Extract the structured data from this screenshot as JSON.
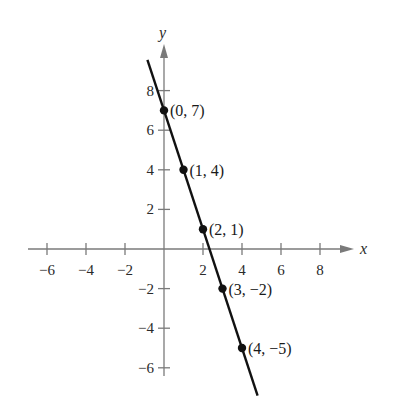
{
  "chart_data": {
    "type": "line",
    "title": "",
    "equation": "y = -3x + 7",
    "xlabel": "x",
    "ylabel": "y",
    "xlim": [
      -7,
      9
    ],
    "ylim": [
      -7,
      9
    ],
    "grid": false,
    "x_ticks": [
      -6,
      -4,
      -2,
      2,
      4,
      6,
      8
    ],
    "x_tick_labels": [
      "−6",
      "−4",
      "−2",
      "2",
      "4",
      "6",
      "8"
    ],
    "y_ticks": [
      8,
      6,
      4,
      2,
      -2,
      -4,
      -6
    ],
    "y_tick_labels": [
      "8",
      "6",
      "4",
      "2",
      "−2",
      "−4",
      "−6"
    ],
    "series": [
      {
        "name": "line",
        "x": [
          0,
          1,
          2,
          3,
          4
        ],
        "y": [
          7,
          4,
          1,
          -2,
          -5
        ]
      }
    ],
    "points": [
      {
        "x": 0,
        "y": 7,
        "label": "(0, 7)"
      },
      {
        "x": 1,
        "y": 4,
        "label": "(1, 4)"
      },
      {
        "x": 2,
        "y": 1,
        "label": "(2, 1)"
      },
      {
        "x": 3,
        "y": -2,
        "label": "(3, −2)"
      },
      {
        "x": 4,
        "y": -5,
        "label": "(4, −5)"
      }
    ],
    "line_extent": {
      "x_start": -0.85,
      "x_end": 4.8
    },
    "colors": {
      "line": "#111111",
      "axis": "#7a7a7a",
      "text": "#1a1a1a"
    }
  },
  "layout": {
    "origin_px": [
      164,
      249
    ],
    "x_unit_px": 19.5,
    "y_unit_px": 19.8,
    "x_axis_px": [
      28,
      354
    ],
    "y_axis_px": [
      376,
      44
    ]
  }
}
